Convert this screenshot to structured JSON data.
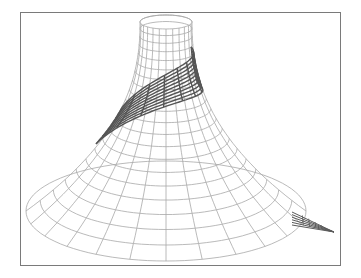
{
  "figure": {
    "description": "Wireframe 3D surface: funnel-shaped surface of revolution with a darker helical band wrapping around it and a sharp spike extending to the right at the base",
    "frame": {
      "x": 20,
      "y": 12,
      "width": 321,
      "height": 254,
      "stroke": "#7a7a7a"
    },
    "colors": {
      "background": "#ffffff",
      "surface_mesh": "#a8a8a8",
      "helix_band": "#555555",
      "spike": "#5a5a5a"
    },
    "surface": {
      "center_x": 166,
      "top": {
        "y": 22,
        "rx": 26,
        "ry": 7
      },
      "base": {
        "y": 211,
        "rx": 140,
        "ry": 50
      },
      "meridians": 24,
      "parallels": 20
    },
    "helix_band": {
      "start_turn_deg": 200,
      "end_turn_deg": 20,
      "t_start": 0.25,
      "t_end": 0.62,
      "width_t": 0.2,
      "radial_lines": 8,
      "long_lines": 10
    },
    "spike": {
      "base_x": 296,
      "base_y": 218,
      "tip_x": 334,
      "tip_y": 232
    }
  }
}
